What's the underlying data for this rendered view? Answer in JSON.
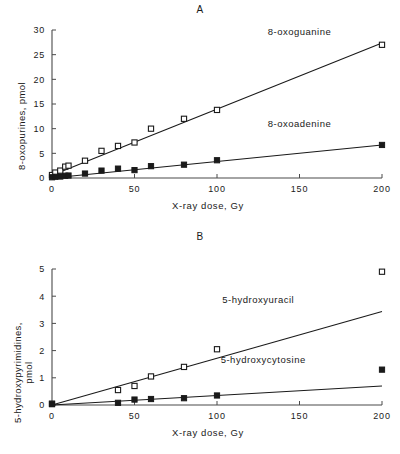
{
  "figure": {
    "panels": [
      {
        "id": "A",
        "title": "A",
        "chart_data": {
          "type": "scatter",
          "title": "A",
          "xlabel": "X-ray dose,  Gy",
          "ylabel": "8-oxopurines,  pmol",
          "xlim": [
            0,
            200
          ],
          "ylim": [
            0,
            30
          ],
          "xticks": [
            0,
            50,
            100,
            150,
            200
          ],
          "yticks": [
            0,
            5,
            10,
            15,
            20,
            25,
            30
          ],
          "xtick_labels": [
            "0",
            "50",
            "100",
            "150",
            "200"
          ],
          "ytick_labels": [
            "0",
            "5",
            "10",
            "15",
            "20",
            "25",
            "30"
          ],
          "grid": false,
          "legend_position": "inline-right",
          "series": [
            {
              "name": "8-oxoguanine",
              "marker": "open-square",
              "label_x": 150,
              "label_y": 29,
              "fit": {
                "slope": 0.134,
                "intercept": 0.55
              },
              "x": [
                0,
                2,
                5,
                8,
                10,
                20,
                30,
                40,
                50,
                60,
                80,
                100,
                200
              ],
              "y": [
                0.6,
                1.1,
                1.5,
                2.3,
                2.5,
                3.5,
                5.5,
                6.5,
                7.2,
                10.0,
                12.0,
                13.8,
                27.0
              ]
            },
            {
              "name": "8-oxoadenine",
              "marker": "filled-square",
              "label_x": 150,
              "label_y": 10.3,
              "fit": {
                "slope": 0.0335,
                "intercept": 0.0
              },
              "x": [
                0,
                2,
                5,
                8,
                10,
                20,
                30,
                40,
                50,
                60,
                80,
                100,
                200
              ],
              "y": [
                0.15,
                0.25,
                0.3,
                0.45,
                0.5,
                0.9,
                1.5,
                1.9,
                1.6,
                2.4,
                2.7,
                3.6,
                6.7
              ]
            }
          ]
        }
      },
      {
        "id": "B",
        "title": "B",
        "chart_data": {
          "type": "scatter",
          "title": "B",
          "xlabel": "X-ray dose,  Gy",
          "ylabel_line1": "5-hydroxypyrimidines,",
          "ylabel_line2": "pmol",
          "ylabel": "5-hydroxypyrimidines, pmol",
          "xlim": [
            0,
            200
          ],
          "ylim": [
            0,
            5
          ],
          "xticks": [
            0,
            50,
            100,
            150,
            200
          ],
          "yticks": [
            0,
            1,
            2,
            3,
            4,
            5
          ],
          "xtick_labels": [
            "0",
            "50",
            "100",
            "150",
            "200"
          ],
          "ytick_labels": [
            "0",
            "1",
            "2",
            "3",
            "4",
            "5"
          ],
          "grid": false,
          "legend_position": "inline-right",
          "series": [
            {
              "name": "5-hydroxyuracil",
              "marker": "open-square",
              "label_x": 125,
              "label_y": 3.75,
              "fit": {
                "slope": 0.0172,
                "intercept": 0.0
              },
              "x": [
                0,
                40,
                50,
                60,
                80,
                100,
                200
              ],
              "y": [
                0.05,
                0.55,
                0.7,
                1.05,
                1.4,
                2.05,
                4.9
              ]
            },
            {
              "name": "5-hydroxycytosine",
              "marker": "filled-square",
              "label_x": 128,
              "label_y": 1.55,
              "fit": {
                "slope": 0.0035,
                "intercept": 0.0
              },
              "x": [
                0,
                40,
                50,
                60,
                80,
                100,
                200
              ],
              "y": [
                0.03,
                0.08,
                0.2,
                0.22,
                0.25,
                0.35,
                1.3
              ]
            }
          ]
        }
      }
    ]
  },
  "colors": {
    "background": "#ffffff",
    "ink": "#1a1a1a",
    "axis": "#4a4a4a"
  }
}
